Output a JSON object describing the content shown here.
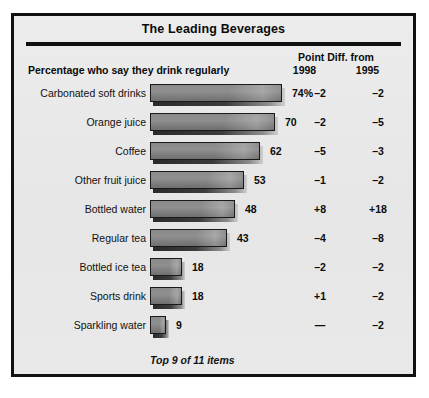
{
  "panel": {
    "title": "The Leading Beverages",
    "subtitle": "Percentage who say they drink regularly",
    "column_group_header": "Point Diff. from",
    "column_1998": "1998",
    "column_1995": "1995",
    "footnote": "Top 9 of 11 items"
  },
  "colors": {
    "panel_background": "#e9e9e9",
    "border": "#111111",
    "bar_fill": "#8a8a8a",
    "bar_outline": "#1a1a1a",
    "text": "#0b0b0b"
  },
  "chart_data": {
    "type": "bar",
    "title": "The Leading Beverages",
    "subtitle": "Percentage who say they drink regularly",
    "xlabel": "",
    "ylabel": "",
    "orientation": "horizontal",
    "xlim": [
      0,
      74
    ],
    "grid": false,
    "legend": "none",
    "categories": [
      "Carbonated soft drinks",
      "Orange juice",
      "Coffee",
      "Other fruit juice",
      "Bottled water",
      "Regular tea",
      "Bottled ice tea",
      "Sports drink",
      "Sparkling water"
    ],
    "values": [
      74,
      70,
      62,
      53,
      48,
      43,
      18,
      18,
      9
    ],
    "value_labels": [
      "74%",
      "70",
      "62",
      "53",
      "48",
      "43",
      "18",
      "18",
      "9"
    ],
    "series": [
      {
        "name": "Percentage who say they drink regularly",
        "values": [
          74,
          70,
          62,
          53,
          48,
          43,
          18,
          18,
          9
        ]
      },
      {
        "name": "Point Diff. from 1998",
        "values": [
          -2,
          -2,
          -5,
          -1,
          8,
          -4,
          -2,
          1,
          null
        ],
        "labels": [
          "–2",
          "–2",
          "–5",
          "–1",
          "+8",
          "–4",
          "–2",
          "+1",
          "—"
        ]
      },
      {
        "name": "Point Diff. from 1995",
        "values": [
          -2,
          -5,
          -3,
          -2,
          18,
          -8,
          -2,
          -2,
          -2
        ],
        "labels": [
          "–2",
          "–5",
          "–3",
          "–2",
          "+18",
          "–8",
          "–2",
          "–2",
          "–2"
        ]
      }
    ],
    "annotations": [
      "Top 9 of 11 items"
    ]
  },
  "rows": [
    {
      "label": "Carbonated soft drinks",
      "value": 74,
      "value_label": "74%",
      "d1998": "–2",
      "d1995": "–2"
    },
    {
      "label": "Orange juice",
      "value": 70,
      "value_label": "70",
      "d1998": "–2",
      "d1995": "–5"
    },
    {
      "label": "Coffee",
      "value": 62,
      "value_label": "62",
      "d1998": "–5",
      "d1995": "–3"
    },
    {
      "label": "Other fruit juice",
      "value": 53,
      "value_label": "53",
      "d1998": "–1",
      "d1995": "–2"
    },
    {
      "label": "Bottled water",
      "value": 48,
      "value_label": "48",
      "d1998": "+8",
      "d1995": "+18"
    },
    {
      "label": "Regular tea",
      "value": 43,
      "value_label": "43",
      "d1998": "–4",
      "d1995": "–8"
    },
    {
      "label": "Bottled ice tea",
      "value": 18,
      "value_label": "18",
      "d1998": "–2",
      "d1995": "–2"
    },
    {
      "label": "Sports drink",
      "value": 18,
      "value_label": "18",
      "d1998": "+1",
      "d1995": "–2"
    },
    {
      "label": "Sparkling water",
      "value": 9,
      "value_label": "9",
      "d1998": "—",
      "d1995": "–2"
    }
  ],
  "scale": {
    "px_per_unit": 1.78,
    "max_value": 74
  }
}
